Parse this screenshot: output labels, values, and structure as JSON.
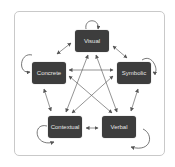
{
  "diagram": {
    "nodes": [
      {
        "id": "visual",
        "label": "Visual"
      },
      {
        "id": "concrete",
        "label": "Concrete"
      },
      {
        "id": "symbolic",
        "label": "Symbolic"
      },
      {
        "id": "contextual",
        "label": "Contextual"
      },
      {
        "id": "verbal",
        "label": "Verbal"
      }
    ],
    "edges": [
      {
        "from": "visual",
        "to": "concrete",
        "type": "bidirectional"
      },
      {
        "from": "visual",
        "to": "symbolic",
        "type": "bidirectional"
      },
      {
        "from": "concrete",
        "to": "contextual",
        "type": "bidirectional"
      },
      {
        "from": "symbolic",
        "to": "verbal",
        "type": "bidirectional"
      },
      {
        "from": "contextual",
        "to": "verbal",
        "type": "bidirectional"
      },
      {
        "from": "concrete",
        "to": "symbolic",
        "type": "bidirectional"
      },
      {
        "from": "visual",
        "to": "contextual",
        "type": "bidirectional"
      },
      {
        "from": "visual",
        "to": "verbal",
        "type": "bidirectional"
      },
      {
        "from": "concrete",
        "to": "verbal",
        "type": "bidirectional"
      },
      {
        "from": "symbolic",
        "to": "contextual",
        "type": "bidirectional"
      },
      {
        "from": "visual",
        "to": "visual",
        "type": "self-loop"
      },
      {
        "from": "concrete",
        "to": "concrete",
        "type": "self-loop"
      },
      {
        "from": "symbolic",
        "to": "symbolic",
        "type": "self-loop"
      },
      {
        "from": "contextual",
        "to": "contextual",
        "type": "self-loop"
      },
      {
        "from": "verbal",
        "to": "verbal",
        "type": "self-loop"
      }
    ],
    "colors": {
      "node_fill": "#3d3d3d",
      "node_text": "#e6e6e6",
      "arrow": "#555555",
      "frame_border": "#c9c9c9"
    }
  }
}
